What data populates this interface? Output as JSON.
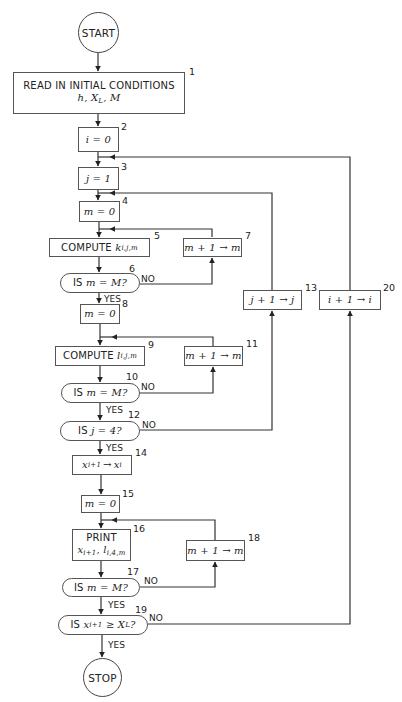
{
  "diagram": {
    "type": "flowchart",
    "start": {
      "label": "START"
    },
    "stop": {
      "label": "STOP"
    },
    "nodes": [
      {
        "id": 1,
        "number": "1",
        "kind": "process",
        "line1": "READ IN INITIAL CONDITIONS",
        "line2": "h, X_L, M"
      },
      {
        "id": 2,
        "number": "2",
        "kind": "process",
        "text": "i = 0"
      },
      {
        "id": 3,
        "number": "3",
        "kind": "process",
        "text": "j = 1"
      },
      {
        "id": 4,
        "number": "4",
        "kind": "process",
        "text": "m = 0"
      },
      {
        "id": 5,
        "number": "5",
        "kind": "process",
        "prefix": "COMPUTE",
        "var": "k",
        "subscript": "i,j,m"
      },
      {
        "id": 6,
        "number": "6",
        "kind": "decision",
        "prefix": "IS",
        "text": "m = M?"
      },
      {
        "id": 7,
        "number": "7",
        "kind": "process",
        "text": "m + 1 → m"
      },
      {
        "id": 8,
        "number": "8",
        "kind": "process",
        "text": "m = 0"
      },
      {
        "id": 9,
        "number": "9",
        "kind": "process",
        "prefix": "COMPUTE",
        "var": "l",
        "subscript": "i,j,m"
      },
      {
        "id": 10,
        "number": "10",
        "kind": "decision",
        "prefix": "IS",
        "text": "m = M?"
      },
      {
        "id": 11,
        "number": "11",
        "kind": "process",
        "text": "m + 1 → m"
      },
      {
        "id": 12,
        "number": "12",
        "kind": "decision",
        "prefix": "IS",
        "text": "j = 4?"
      },
      {
        "id": 13,
        "number": "13",
        "kind": "process",
        "text": "j + 1 → j"
      },
      {
        "id": 14,
        "number": "14",
        "kind": "process",
        "var": "x",
        "subscript": "i+1",
        "arrow": "→",
        "var2": "x",
        "subscript2": "i"
      },
      {
        "id": 15,
        "number": "15",
        "kind": "process",
        "text": "m = 0"
      },
      {
        "id": 16,
        "number": "16",
        "kind": "process",
        "line1": "PRINT",
        "var": "x",
        "subscript": "i+1",
        "sep": ", ",
        "var2": "l",
        "subscript2": "i,4,m"
      },
      {
        "id": 17,
        "number": "17",
        "kind": "decision",
        "prefix": "IS",
        "text": "m = M?"
      },
      {
        "id": 18,
        "number": "18",
        "kind": "process",
        "text": "m + 1 → m"
      },
      {
        "id": 19,
        "number": "19",
        "kind": "decision",
        "prefix": "IS",
        "var": "x",
        "subscript": "i+1",
        "rel": " ≥ ",
        "var2": "X",
        "subscript2": "L",
        "suffix": "?"
      },
      {
        "id": 20,
        "number": "20",
        "kind": "process",
        "text": "i + 1 → i"
      }
    ],
    "labels": {
      "yes": "YES",
      "no": "NO"
    },
    "read_vars": {
      "h": "h",
      "sep": ", ",
      "X": "X",
      "L": "L",
      "M": "M"
    },
    "edges": [
      {
        "from": "START",
        "to": 1
      },
      {
        "from": 1,
        "to": 2
      },
      {
        "from": 2,
        "to": 3
      },
      {
        "from": 3,
        "to": 4
      },
      {
        "from": 4,
        "to": 5
      },
      {
        "from": 5,
        "to": 6
      },
      {
        "from": 6,
        "to": 8,
        "label": "YES"
      },
      {
        "from": 6,
        "to": 7,
        "label": "NO"
      },
      {
        "from": 7,
        "to": 5
      },
      {
        "from": 8,
        "to": 9
      },
      {
        "from": 9,
        "to": 10
      },
      {
        "from": 10,
        "to": 12,
        "label": "YES"
      },
      {
        "from": 10,
        "to": 11,
        "label": "NO"
      },
      {
        "from": 11,
        "to": 9
      },
      {
        "from": 12,
        "to": 14,
        "label": "YES"
      },
      {
        "from": 12,
        "to": 13,
        "label": "NO"
      },
      {
        "from": 13,
        "to": 4
      },
      {
        "from": 14,
        "to": 15
      },
      {
        "from": 15,
        "to": 16
      },
      {
        "from": 16,
        "to": 17
      },
      {
        "from": 17,
        "to": 19,
        "label": "YES"
      },
      {
        "from": 17,
        "to": 18,
        "label": "NO"
      },
      {
        "from": 18,
        "to": 16
      },
      {
        "from": 19,
        "to": "STOP",
        "label": "YES"
      },
      {
        "from": 19,
        "to": 20,
        "label": "NO"
      },
      {
        "from": 20,
        "to": 3
      }
    ]
  }
}
